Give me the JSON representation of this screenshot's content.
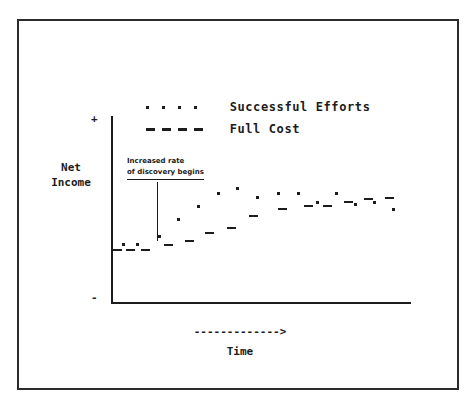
{
  "figure": {
    "frame": true,
    "background": "#ffffff",
    "ink": "#1c1c1c"
  },
  "axes": {
    "y_title": "Net\nIncome",
    "y_tick_top": "+",
    "y_tick_bottom": "-",
    "x_title": "Time",
    "x_arrow": "------------->"
  },
  "legend": {
    "position": "top-center",
    "entries": [
      {
        "label": "Successful Efforts",
        "marker": "dotted",
        "marker_name": "dotted-line-swatch"
      },
      {
        "label": "Full Cost",
        "marker": "dashed",
        "marker_name": "dashed-line-swatch"
      }
    ]
  },
  "annotation": {
    "line1": "Increased rate",
    "line2": "of discovery begins",
    "underline_line2": true,
    "leader_line": true
  },
  "chart_data": {
    "type": "scatter",
    "title": "",
    "subtitle": "",
    "xlabel": "Time",
    "ylabel": "Net Income",
    "grid": false,
    "legend_position": "top-center",
    "xlim": [
      0,
      100
    ],
    "ylim": [
      -1,
      1
    ],
    "axis_tick_labels": {
      "y": [
        "+",
        "-"
      ],
      "x": []
    },
    "annotations": [
      {
        "text": "Increased rate of discovery begins",
        "x": 15,
        "y": 0.52,
        "leader_to_x": 15,
        "leader_to_y": 0.06
      }
    ],
    "series": [
      {
        "name": "Successful Efforts",
        "marker": "dot",
        "points": [
          {
            "x": 2.7,
            "y": -0.118
          },
          {
            "x": 7.4,
            "y": -0.118
          },
          {
            "x": 15.0,
            "y": -0.075
          },
          {
            "x": 21.5,
            "y": 0.01
          },
          {
            "x": 28.2,
            "y": 0.075
          },
          {
            "x": 35.0,
            "y": 0.14
          },
          {
            "x": 41.5,
            "y": 0.165
          },
          {
            "x": 48.5,
            "y": 0.118
          },
          {
            "x": 55.5,
            "y": 0.14
          },
          {
            "x": 62.5,
            "y": 0.14
          },
          {
            "x": 69.0,
            "y": 0.095
          },
          {
            "x": 75.5,
            "y": 0.14
          },
          {
            "x": 82.0,
            "y": 0.085
          },
          {
            "x": 88.5,
            "y": 0.095
          },
          {
            "x": 95.0,
            "y": 0.06
          }
        ]
      },
      {
        "name": "Full Cost",
        "marker": "dash",
        "points": [
          {
            "x": 0.5,
            "y": -0.145
          },
          {
            "x": 5.0,
            "y": -0.145
          },
          {
            "x": 10.0,
            "y": -0.145
          },
          {
            "x": 18.0,
            "y": -0.122
          },
          {
            "x": 25.0,
            "y": -0.1
          },
          {
            "x": 32.0,
            "y": -0.06
          },
          {
            "x": 39.5,
            "y": -0.035
          },
          {
            "x": 47.0,
            "y": 0.025
          },
          {
            "x": 57.0,
            "y": 0.058
          },
          {
            "x": 66.0,
            "y": 0.075
          },
          {
            "x": 72.5,
            "y": 0.075
          },
          {
            "x": 79.5,
            "y": 0.095
          },
          {
            "x": 86.5,
            "y": 0.11
          },
          {
            "x": 93.5,
            "y": 0.115
          }
        ]
      }
    ]
  }
}
